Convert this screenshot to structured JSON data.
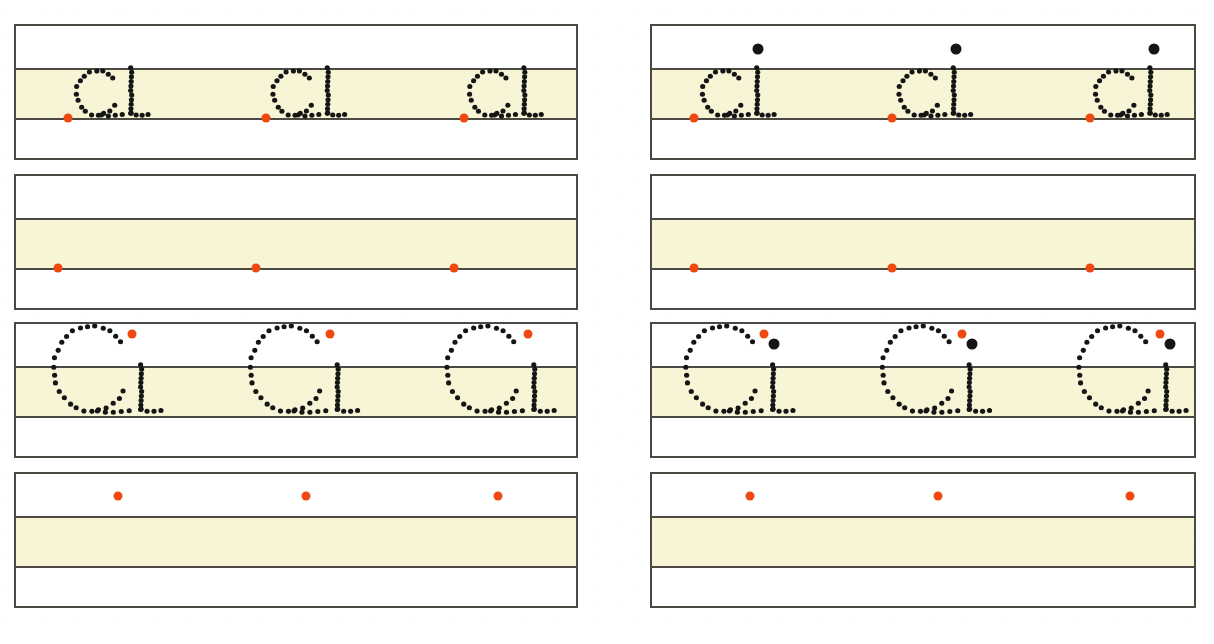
{
  "worksheet": {
    "title": "Letter tracing practice worksheet",
    "page_width": 1214,
    "page_height": 644,
    "paper_color": "#ffffff",
    "rule_color": "#4a4a42",
    "xheight_band_color": "#f7f5d5",
    "start_dot_color": "#ee4911",
    "tittle_dot_color": "#151515",
    "stroke_dot_color": "#151515",
    "columns": 2,
    "rows": 4,
    "repetitions_per_row": 3
  },
  "geometry": {
    "columns": [
      {
        "name": "left-column",
        "x": 14,
        "width": 564
      },
      {
        "name": "right-column",
        "x": 650,
        "width": 546
      }
    ],
    "rows": [
      {
        "name": "row-1",
        "y": 24,
        "height": 136
      },
      {
        "name": "row-2",
        "y": 174,
        "height": 136
      },
      {
        "name": "row-3",
        "y": 322,
        "height": 136
      },
      {
        "name": "row-4",
        "y": 472,
        "height": 136
      }
    ],
    "band_top_offset": 44,
    "band_height": 48
  },
  "boxes": [
    {
      "id": "box-r1c1",
      "row": 1,
      "column": 1,
      "glyph": "ci-lowercase",
      "glyph_case": "lowercase",
      "glyph_zone": "x-height",
      "traceable": true,
      "has_tittle": false,
      "start_dot_position": "baseline",
      "repetitions": 3,
      "start_dots_x": [
        52,
        250,
        448
      ],
      "glyph_origin_x": [
        52,
        250,
        448
      ]
    },
    {
      "id": "box-r1c2",
      "row": 1,
      "column": 2,
      "glyph": "ci-lowercase",
      "glyph_case": "lowercase",
      "glyph_zone": "x-height",
      "traceable": true,
      "has_tittle": true,
      "start_dot_position": "baseline",
      "repetitions": 3,
      "start_dots_x": [
        42,
        240,
        438
      ],
      "glyph_origin_x": [
        42,
        240,
        438
      ]
    },
    {
      "id": "box-r2c1",
      "row": 2,
      "column": 1,
      "glyph": "blank",
      "glyph_case": "lowercase",
      "glyph_zone": "x-height",
      "traceable": false,
      "has_tittle": false,
      "start_dot_position": "baseline",
      "repetitions": 3,
      "start_dots_x": [
        42,
        240,
        438
      ],
      "glyph_origin_x": []
    },
    {
      "id": "box-r2c2",
      "row": 2,
      "column": 2,
      "glyph": "blank",
      "glyph_case": "lowercase",
      "glyph_zone": "x-height",
      "traceable": false,
      "has_tittle": false,
      "start_dot_position": "baseline",
      "repetitions": 3,
      "start_dots_x": [
        42,
        240,
        438
      ],
      "glyph_origin_x": []
    },
    {
      "id": "box-r3c1",
      "row": 3,
      "column": 1,
      "glyph": "Ci-capital",
      "glyph_case": "capital",
      "glyph_zone": "full-height",
      "traceable": true,
      "has_tittle": false,
      "start_dot_position": "upper-right-of-bowl",
      "repetitions": 3,
      "start_dots_x": [
        116,
        314,
        512
      ],
      "glyph_origin_x": [
        30,
        228,
        426
      ]
    },
    {
      "id": "box-r3c2",
      "row": 3,
      "column": 2,
      "glyph": "Ci-capital",
      "glyph_case": "capital",
      "glyph_zone": "full-height",
      "traceable": true,
      "has_tittle": true,
      "start_dot_position": "upper-right-of-bowl",
      "repetitions": 3,
      "start_dots_x": [
        112,
        310,
        508
      ],
      "glyph_origin_x": [
        26,
        224,
        422
      ]
    },
    {
      "id": "box-r4c1",
      "row": 4,
      "column": 1,
      "glyph": "blank",
      "glyph_case": "capital",
      "glyph_zone": "full-height",
      "traceable": false,
      "has_tittle": false,
      "start_dot_position": "top-line",
      "repetitions": 3,
      "start_dots_x": [
        102,
        290,
        482
      ],
      "glyph_origin_x": []
    },
    {
      "id": "box-r4c2",
      "row": 4,
      "column": 2,
      "glyph": "blank",
      "glyph_case": "capital",
      "glyph_zone": "full-height",
      "traceable": false,
      "has_tittle": false,
      "start_dot_position": "top-line",
      "repetitions": 3,
      "start_dots_x": [
        98,
        286,
        478
      ],
      "glyph_origin_x": []
    }
  ],
  "glyph_strokes": {
    "ci-lowercase": {
      "description": "dotted lowercase c followed by lowercase i, both sitting on the baseline within the x-height band",
      "width": 86,
      "c_bowl": {
        "cx": 30,
        "cy": 24,
        "rx": 21,
        "ry": 23,
        "start_angle": 40,
        "sweep": 285,
        "dot_count": 17
      },
      "i_stem": {
        "x": 64,
        "y_top": -2,
        "y_bottom": 45,
        "dot_count": 11
      },
      "i_tail": [
        {
          "x": 64,
          "y": 45
        },
        {
          "x": 69,
          "y": 47
        },
        {
          "x": 75,
          "y": 47
        },
        {
          "x": 81,
          "y": 46
        }
      ],
      "c_tail": [
        {
          "x": 34,
          "y": 47
        },
        {
          "x": 41,
          "y": 48
        },
        {
          "x": 48,
          "y": 47
        },
        {
          "x": 55,
          "y": 46
        }
      ],
      "tittle": {
        "x": 64,
        "y": -22,
        "r": 5
      }
    },
    "Ci-capital": {
      "description": "dotted capital C spanning top line to baseline, followed by a short i stroke",
      "width": 130,
      "c_bowl": {
        "cx": 46,
        "cy": 46,
        "rx": 38,
        "ry": 44,
        "start_angle": 38,
        "sweep": 290,
        "dot_count": 26
      },
      "i_stem": {
        "x": 96,
        "y_top": 42,
        "y_bottom": 88,
        "dot_count": 11
      },
      "i_tail": [
        {
          "x": 96,
          "y": 88
        },
        {
          "x": 102,
          "y": 90
        },
        {
          "x": 109,
          "y": 90
        },
        {
          "x": 116,
          "y": 89
        }
      ],
      "c_tail": [
        {
          "x": 52,
          "y": 90
        },
        {
          "x": 60,
          "y": 91
        },
        {
          "x": 68,
          "y": 91
        },
        {
          "x": 76,
          "y": 90
        },
        {
          "x": 84,
          "y": 89
        }
      ],
      "tittle": {
        "x": 96,
        "y": 20,
        "r": 6
      }
    }
  },
  "dot_sizes": {
    "stroke_dot_radius": 2.6,
    "start_dot_diameter": 9,
    "tittle_dot_diameter": 11
  }
}
